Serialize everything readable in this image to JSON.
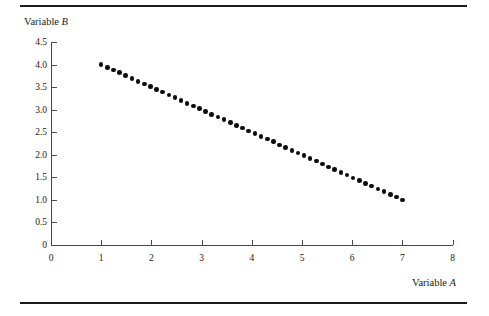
{
  "figure": {
    "top_rule": "",
    "bottom_rule": ""
  },
  "chart_data": {
    "type": "scatter",
    "title": "",
    "xlabel_prefix": "Variable",
    "xlabel_var": "A",
    "ylabel_prefix": "Variable",
    "ylabel_var": "B",
    "xlabel": "Variable A",
    "ylabel": "Variable B",
    "xlim": [
      0,
      8
    ],
    "ylim": [
      0,
      4.5
    ],
    "grid": false,
    "legend": null,
    "xticks": [
      0,
      1,
      2,
      3,
      4,
      5,
      6,
      7,
      8
    ],
    "xtick_labels": [
      "0",
      "1",
      "2",
      "3",
      "4",
      "5",
      "6",
      "7",
      "8"
    ],
    "yticks": [
      0,
      0.5,
      1.0,
      1.5,
      2.0,
      2.5,
      3.0,
      3.5,
      4.0,
      4.5
    ],
    "ytick_labels": [
      "0",
      "0.5",
      "1.0",
      "1.5",
      "2.0",
      "2.5",
      "3.0",
      "3.5",
      "4.0",
      "4.5"
    ],
    "marker": "filled-circle",
    "marker_color": "#0d0d0d",
    "relationship": "perfect negative linear",
    "x": [
      1.0,
      1.12,
      1.24,
      1.37,
      1.49,
      1.61,
      1.73,
      1.86,
      1.98,
      2.1,
      2.22,
      2.35,
      2.47,
      2.59,
      2.71,
      2.84,
      2.96,
      3.08,
      3.2,
      3.33,
      3.45,
      3.57,
      3.69,
      3.82,
      3.94,
      4.06,
      4.18,
      4.31,
      4.43,
      4.55,
      4.67,
      4.8,
      4.92,
      5.04,
      5.16,
      5.29,
      5.41,
      5.53,
      5.65,
      5.78,
      5.9,
      6.02,
      6.14,
      6.27,
      6.39,
      6.51,
      6.63,
      6.76,
      6.88,
      7.0
    ],
    "y": [
      4.0,
      3.94,
      3.88,
      3.82,
      3.76,
      3.69,
      3.63,
      3.57,
      3.51,
      3.45,
      3.39,
      3.33,
      3.27,
      3.2,
      3.14,
      3.08,
      3.02,
      2.96,
      2.9,
      2.84,
      2.78,
      2.71,
      2.65,
      2.59,
      2.53,
      2.47,
      2.41,
      2.35,
      2.29,
      2.22,
      2.16,
      2.1,
      2.04,
      1.98,
      1.92,
      1.86,
      1.8,
      1.73,
      1.67,
      1.61,
      1.55,
      1.49,
      1.43,
      1.37,
      1.31,
      1.24,
      1.18,
      1.12,
      1.06,
      1.0
    ]
  }
}
